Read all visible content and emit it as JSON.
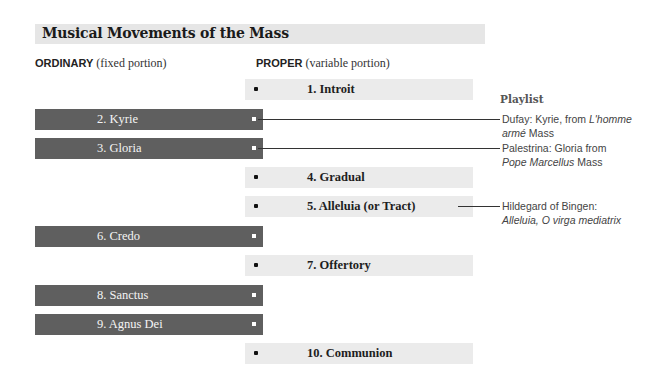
{
  "title": "Musical Movements of the Mass",
  "columns": {
    "ordinary": {
      "label": "ORDINARY",
      "desc": "(fixed portion)"
    },
    "proper": {
      "label": "PROPER",
      "desc": "(variable portion)"
    }
  },
  "ordinary": [
    {
      "label": "2. Kyrie"
    },
    {
      "label": "3. Gloria"
    },
    {
      "label": "6. Credo"
    },
    {
      "label": "8. Sanctus"
    },
    {
      "label": "9. Agnus Dei"
    }
  ],
  "proper": [
    {
      "label": "1. Introit"
    },
    {
      "label": "4. Gradual"
    },
    {
      "label": "5. Alleluia (or Tract)"
    },
    {
      "label": "7. Offertory"
    },
    {
      "label": "10. Communion"
    }
  ],
  "playlist": {
    "title": "Playlist",
    "items": [
      {
        "line1a": "Dufay: Kyrie, from ",
        "line1b": "L'homme",
        "line2a": "armé",
        "line2b": " Mass"
      },
      {
        "line1a": "Palestrina: Gloria from",
        "line1b": "",
        "line2a": "Pope Marcellus",
        "line2b": " Mass"
      },
      {
        "line1a": "Hildegard of Bingen:",
        "line1b": "",
        "line2a": "Alleluia, O virga mediatrix",
        "line2b": ""
      }
    ]
  },
  "colors": {
    "ordinary_bar": "#5f5f5f",
    "proper_bar": "#ebebeb",
    "title_bar": "#e6e6e6"
  }
}
